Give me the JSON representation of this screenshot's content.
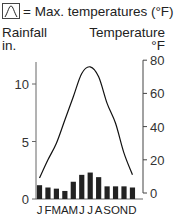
{
  "legend": {
    "icon": "temperature-curve-icon",
    "text": "= Max. temperatures (°F)"
  },
  "left_axis": {
    "title_line1": "Rainfall",
    "title_line2": "in.",
    "ticks": [
      "0",
      "5",
      "10"
    ]
  },
  "right_axis": {
    "title_line1": "Temperature",
    "title_line2": "°F",
    "ticks": [
      "0",
      "20",
      "40",
      "60",
      "80"
    ]
  },
  "months": [
    "J",
    "F",
    "M",
    "A",
    "M",
    "J",
    "J",
    "A",
    "S",
    "O",
    "N",
    "D"
  ],
  "chart_data": {
    "type": "bar+line",
    "title": "",
    "categories": [
      "Jan",
      "Feb",
      "Mar",
      "Apr",
      "May",
      "Jun",
      "Jul",
      "Aug",
      "Sep",
      "Oct",
      "Nov",
      "Dec"
    ],
    "tick_labels": [
      "J",
      "F",
      "M",
      "A",
      "M",
      "J",
      "J",
      "A",
      "S",
      "O",
      "N",
      "D"
    ],
    "series": [
      {
        "name": "Rainfall (in.)",
        "type": "bar",
        "axis": "left",
        "values": [
          1.2,
          1.0,
          0.9,
          0.7,
          1.5,
          2.1,
          2.3,
          1.9,
          1.1,
          1.1,
          1.1,
          1.0
        ]
      },
      {
        "name": "Max. temperatures (°F)",
        "type": "line",
        "axis": "right",
        "values": [
          9,
          20,
          30,
          44,
          58,
          72,
          76,
          70,
          54,
          42,
          24,
          11
        ]
      }
    ],
    "ylabel_left": "Rainfall in.",
    "ylim_left": [
      0,
      12
    ],
    "yticks_left": [
      0,
      5,
      10
    ],
    "ylabel_right": "Temperature °F",
    "ylim_right": [
      0,
      80
    ],
    "yticks_right": [
      0,
      20,
      40,
      60,
      80
    ],
    "legend": [
      "= Max. temperatures (°F)"
    ],
    "grid": false
  }
}
